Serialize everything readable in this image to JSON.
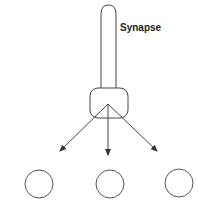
{
  "diagram": {
    "label": "Synapse",
    "nodes": [
      {
        "id": "target-1"
      },
      {
        "id": "target-2"
      },
      {
        "id": "target-3"
      }
    ],
    "arrows": 3,
    "colors": {
      "stroke": "#444444",
      "text": "#222222"
    }
  }
}
